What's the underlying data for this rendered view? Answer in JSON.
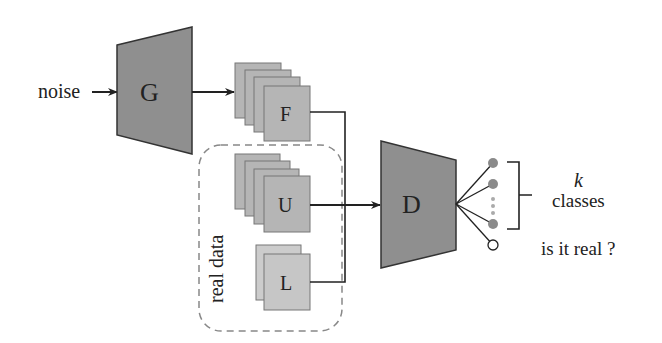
{
  "diagram": {
    "input_label": "noise",
    "generator_label": "G",
    "fake_label": "F",
    "unlabeled_label": "U",
    "labeled_label": "L",
    "real_data_label": "real data",
    "discriminator_label": "D",
    "k_label": "k",
    "classes_label": "classes",
    "real_question": "is it real ?"
  },
  "colors": {
    "block": "#8f8f8f",
    "stack": "#b5b5b5",
    "stack_light": "#cccccc",
    "line": "#222222",
    "dot": "#8a8a8a"
  }
}
